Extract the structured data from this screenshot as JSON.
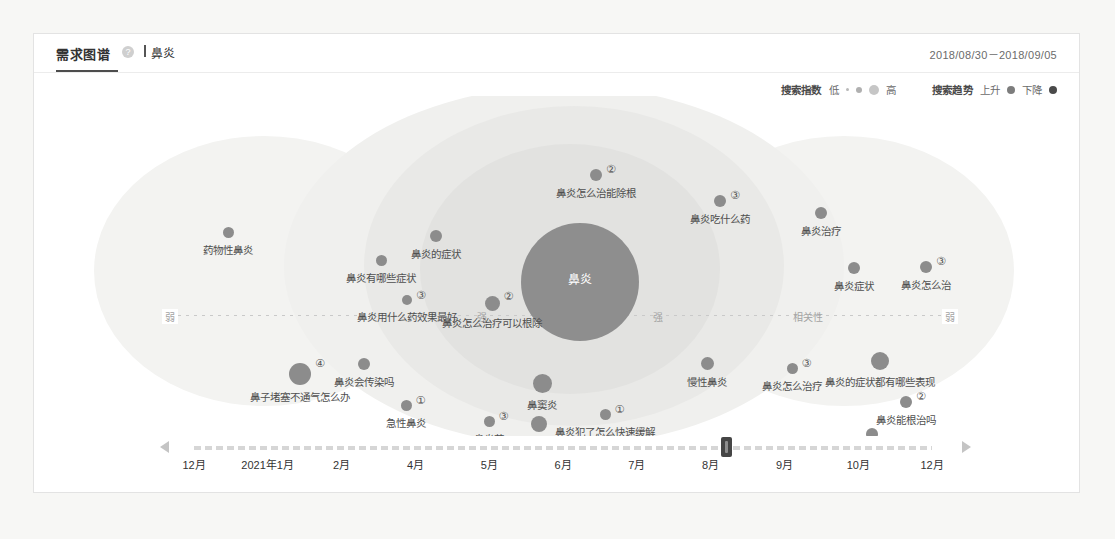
{
  "page": {
    "background": "#f7f7f5",
    "card_background": "#ffffff"
  },
  "header": {
    "tab_label": "需求图谱",
    "help_icon": "question-mark-icon",
    "keyword": "鼻炎",
    "date_range": "2018/08/30－2018/09/05"
  },
  "legend": {
    "index_title": "搜索指数",
    "index_low": "低",
    "index_high": "高",
    "trend_title": "搜索趋势",
    "trend_up": "上升",
    "trend_down": "下降",
    "dot_color": "#b9b9b9",
    "trend_up_color": "#7d7d7d",
    "trend_down_color": "#4a4a4a"
  },
  "axis": {
    "left_weak": "弱",
    "mid_strong_left": "强",
    "mid_strong_right": "强",
    "center_label": "相关性",
    "right_weak": "弱"
  },
  "center": {
    "label": "鼻炎",
    "color": "#8e8e8e"
  },
  "chart_data": {
    "type": "scatter",
    "title": "需求图谱",
    "keyword": "鼻炎",
    "xlabel": "相关性",
    "ylabel": "",
    "legend_position": "top-right",
    "grid": false,
    "nodes": [
      {
        "label": "药物性鼻炎",
        "x": 194,
        "y": 198,
        "r": 5.5,
        "rank": "",
        "color": "#8c8c8c"
      },
      {
        "label": "鼻炎有哪些症状",
        "x": 347,
        "y": 226,
        "r": 5.5,
        "rank": "",
        "color": "#8c8c8c"
      },
      {
        "label": "鼻炎的症状",
        "x": 402,
        "y": 202,
        "r": 6.0,
        "rank": "",
        "color": "#8c8c8c"
      },
      {
        "label": "鼻炎用什么药效果最好",
        "x": 373,
        "y": 266,
        "r": 5.0,
        "rank": "③",
        "color": "#8c8c8c"
      },
      {
        "label": "鼻炎怎么治疗可以根除",
        "x": 458,
        "y": 269,
        "r": 7.5,
        "rank": "②",
        "color": "#8c8c8c"
      },
      {
        "label": "鼻炎怎么治能除根",
        "x": 562,
        "y": 141,
        "r": 6.0,
        "rank": "②",
        "color": "#8c8c8c"
      },
      {
        "label": "鼻炎吃什么药",
        "x": 686,
        "y": 167,
        "r": 6.0,
        "rank": "③",
        "color": "#8c8c8c"
      },
      {
        "label": "鼻炎治疗",
        "x": 787,
        "y": 179,
        "r": 6.0,
        "rank": "",
        "color": "#8c8c8c"
      },
      {
        "label": "鼻炎症状",
        "x": 820,
        "y": 234,
        "r": 6.0,
        "rank": "",
        "color": "#8c8c8c"
      },
      {
        "label": "鼻炎怎么治",
        "x": 892,
        "y": 233,
        "r": 6.0,
        "rank": "③",
        "color": "#8c8c8c"
      },
      {
        "label": "鼻炎的症状都有哪些表现",
        "x": 846,
        "y": 327,
        "r": 9.0,
        "rank": "",
        "color": "#8c8c8c"
      },
      {
        "label": "鼻炎怎么治疗",
        "x": 758,
        "y": 334,
        "r": 5.5,
        "rank": "③",
        "color": "#8c8c8c"
      },
      {
        "label": "慢性鼻炎",
        "x": 673,
        "y": 329,
        "r": 6.5,
        "rank": "",
        "color": "#8c8c8c"
      },
      {
        "label": "鼻炎能根治吗",
        "x": 872,
        "y": 368,
        "r": 6.0,
        "rank": "②",
        "color": "#8c8c8c"
      },
      {
        "label": "鼻炎手术",
        "x": 838,
        "y": 400,
        "r": 6.0,
        "rank": "",
        "color": "#8c8c8c"
      },
      {
        "label": "鼻息肉",
        "x": 800,
        "y": 419,
        "r": 7.0,
        "rank": "",
        "color": "#8c8c8c"
      },
      {
        "label": "鼻子堵塞不通气怎么办",
        "x": 266,
        "y": 340,
        "r": 11.0,
        "rank": "④",
        "color": "#8c8c8c"
      },
      {
        "label": "鼻炎会传染吗",
        "x": 330,
        "y": 330,
        "r": 6.0,
        "rank": "",
        "color": "#8c8c8c"
      },
      {
        "label": "急性鼻炎",
        "x": 372,
        "y": 371,
        "r": 5.5,
        "rank": "①",
        "color": "#8c8c8c"
      },
      {
        "label": "鼻炎药",
        "x": 455,
        "y": 387,
        "r": 5.5,
        "rank": "③",
        "color": "#8c8c8c"
      },
      {
        "label": "过敏性鼻炎",
        "x": 505,
        "y": 390,
        "r": 8.0,
        "rank": "",
        "color": "#8c8c8c"
      },
      {
        "label": "鼻炎犯了怎么快速缓解",
        "x": 571,
        "y": 380,
        "r": 5.5,
        "rank": "①",
        "color": "#8c8c8c"
      },
      {
        "label": "鼻窦炎",
        "x": 508,
        "y": 349,
        "r": 9.5,
        "rank": "",
        "color": "#8c8c8c"
      }
    ]
  },
  "timeline": {
    "ticks": [
      "12月",
      "2021年1月",
      "2月",
      "4月",
      "5月",
      "6月",
      "7月",
      "8月",
      "9月",
      "10月",
      "12月"
    ],
    "handle_position_pct": 71,
    "prev_icon": "triangle-left-icon",
    "next_icon": "triangle-right-icon"
  }
}
